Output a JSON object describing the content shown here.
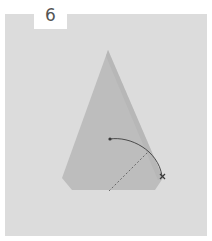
{
  "step": {
    "number": "6"
  },
  "diagram": {
    "type": "origami-fold-instruction",
    "paper_shape": "kite",
    "colors": {
      "background_panel": "#dcdcdc",
      "paper": "#bdbdbd",
      "paper_shadow": "#b0b0b0",
      "line": "#5a5a5a",
      "tab": "#ffffff"
    },
    "symbols": [
      {
        "name": "fold-arrow",
        "from": "center-dot",
        "to": "x-mark"
      },
      {
        "name": "valley-fold-line",
        "style": "dashed"
      }
    ]
  }
}
